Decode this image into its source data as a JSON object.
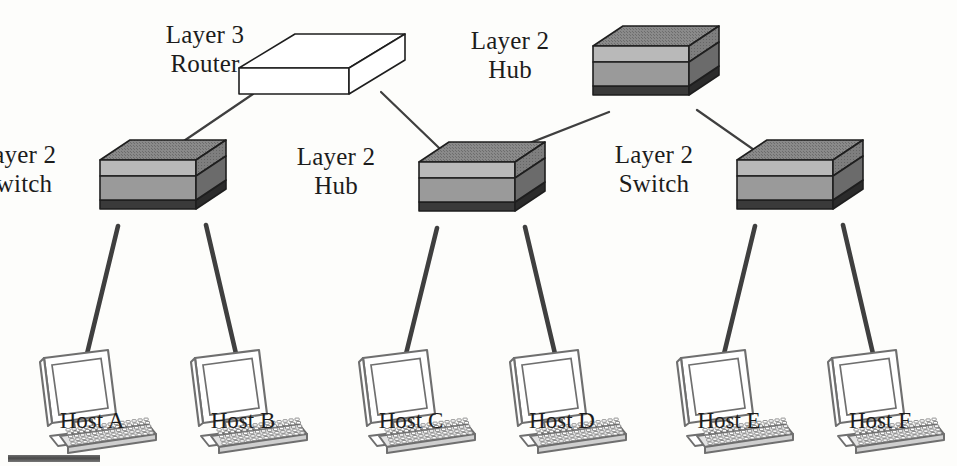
{
  "diagram": {
    "colors": {
      "background": "#fdfdfb",
      "ink": "#1c1c1c",
      "wire": "#3f3f3f",
      "device_top": "#8a8a8a",
      "device_front_light": "#b9b9b9",
      "device_front_dark": "#9a9a9a",
      "device_side": "#7e7e7e",
      "device_base": "#3a3a3a",
      "router_fill": "#ffffff",
      "computer_line": "#6f6f6f"
    },
    "devices": [
      {
        "id": "router",
        "type": "router-3d-box",
        "label": "Layer 3\nRouter",
        "label_side": "left",
        "x": 294,
        "y": 68
      },
      {
        "id": "hub-top",
        "type": "device-3d-box",
        "label": "Layer 2\nHub",
        "label_side": "left",
        "x": 641,
        "y": 66
      },
      {
        "id": "switch-left",
        "type": "device-3d-box",
        "label": "Layer 2\nSwitch",
        "label_side": "left",
        "x": 148,
        "y": 180
      },
      {
        "id": "hub-middle",
        "type": "device-3d-box",
        "label": "Layer 2\nHub",
        "label_side": "left",
        "x": 467,
        "y": 182
      },
      {
        "id": "switch-right",
        "type": "device-3d-box",
        "label": "Layer 2\nSwitch",
        "label_side": "left",
        "x": 785,
        "y": 180
      }
    ],
    "hosts": [
      {
        "id": "host-a",
        "label": "Host A",
        "x": 92,
        "y": 340
      },
      {
        "id": "host-b",
        "label": "Host B",
        "x": 243,
        "y": 340
      },
      {
        "id": "host-c",
        "label": "Host C",
        "x": 411,
        "y": 340
      },
      {
        "id": "host-d",
        "label": "Host D",
        "x": 562,
        "y": 340
      },
      {
        "id": "host-e",
        "label": "Host E",
        "x": 729,
        "y": 340
      },
      {
        "id": "host-f",
        "label": "Host F",
        "x": 880,
        "y": 340
      }
    ],
    "links": [
      {
        "id": "link-router-switch-left",
        "from": "router",
        "to": "switch-left",
        "weight": "thin"
      },
      {
        "id": "link-router-hub-middle",
        "from": "router",
        "to": "hub-middle",
        "weight": "thin"
      },
      {
        "id": "link-hubtop-hub-middle",
        "from": "hub-top",
        "to": "hub-middle",
        "weight": "thin"
      },
      {
        "id": "link-hubtop-switch-right",
        "from": "hub-top",
        "to": "switch-right",
        "weight": "thin"
      },
      {
        "id": "link-switchleft-host-a",
        "from": "switch-left",
        "to": "host-a",
        "weight": "thick"
      },
      {
        "id": "link-switchleft-host-b",
        "from": "switch-left",
        "to": "host-b",
        "weight": "thick"
      },
      {
        "id": "link-hubmiddle-host-c",
        "from": "hub-middle",
        "to": "host-c",
        "weight": "thick"
      },
      {
        "id": "link-hubmiddle-host-d",
        "from": "hub-middle",
        "to": "host-d",
        "weight": "thick"
      },
      {
        "id": "link-switchright-host-e",
        "from": "switch-right",
        "to": "host-e",
        "weight": "thick"
      },
      {
        "id": "link-switchright-host-f",
        "from": "switch-right",
        "to": "host-f",
        "weight": "thick"
      }
    ],
    "artifact": {
      "id": "scan-bar",
      "note": "scan artifact bar"
    }
  }
}
